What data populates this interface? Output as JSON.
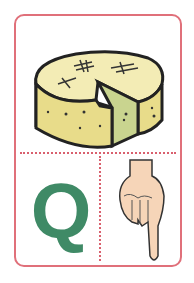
{
  "card": {
    "picture": "cheese",
    "letter": "Q",
    "sign": "hand-sign-q",
    "colors": {
      "border": "#e0707a",
      "dots": "#d9606e",
      "letter": "#3f8a66",
      "cheese_rind": "#e8dc8a",
      "cheese_top": "#f3ecb5",
      "cheese_cut": "#c9d48f",
      "skin": "#f6d5b8"
    }
  }
}
